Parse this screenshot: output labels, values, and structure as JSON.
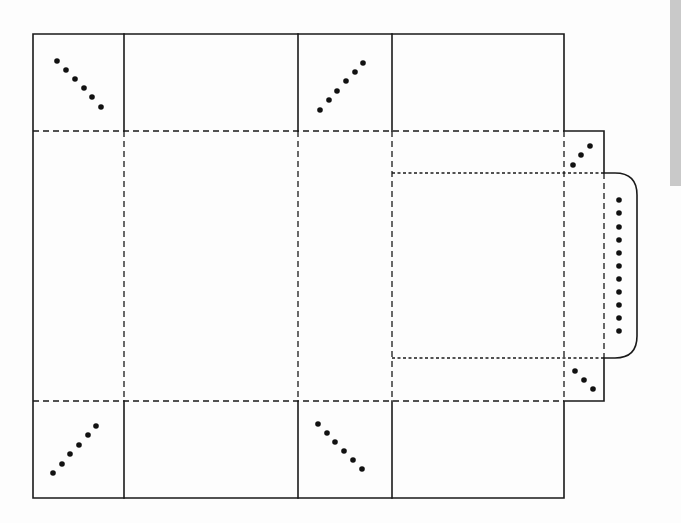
{
  "figure": {
    "title": ""
  },
  "colors": {
    "line": "#1a1a1a",
    "dot": "#111111",
    "background": "#fdfdfd",
    "edge_bar": "#c9c9c9"
  },
  "geometry": {
    "columns_x": [
      33,
      124,
      298,
      392,
      564
    ],
    "rows_y": [
      34,
      131,
      401,
      498
    ],
    "side_tab": {
      "x1": 564,
      "x2": 604,
      "top_y1": 131,
      "top_y2": 173,
      "bottom_y1": 358,
      "bottom_y2": 401
    },
    "inner_panel": {
      "x1": 392,
      "x2": 604,
      "y1": 173,
      "y2": 358
    },
    "rounded_flap": {
      "x1": 604,
      "x2": 637,
      "y1": 173,
      "y2": 358,
      "radius": 22
    }
  },
  "glue_markers": [
    {
      "name": "top-left-corner-flap",
      "points": [
        [
          57,
          61
        ],
        [
          66,
          70
        ],
        [
          75,
          79
        ],
        [
          84,
          88
        ],
        [
          92,
          97
        ],
        [
          101,
          107
        ]
      ]
    },
    {
      "name": "top-mid-corner-flap",
      "points": [
        [
          320,
          110
        ],
        [
          329,
          100
        ],
        [
          337,
          91
        ],
        [
          346,
          81
        ],
        [
          355,
          72
        ],
        [
          363,
          63
        ]
      ]
    },
    {
      "name": "bottom-left-corner-flap",
      "points": [
        [
          53,
          473
        ],
        [
          62,
          464
        ],
        [
          70,
          454
        ],
        [
          79,
          445
        ],
        [
          88,
          435
        ],
        [
          96,
          426
        ]
      ]
    },
    {
      "name": "bottom-mid-corner-flap",
      "points": [
        [
          318,
          424
        ],
        [
          327,
          433
        ],
        [
          335,
          442
        ],
        [
          344,
          451
        ],
        [
          353,
          460
        ],
        [
          362,
          469
        ]
      ]
    },
    {
      "name": "top-side-tab",
      "points": [
        [
          573,
          165
        ],
        [
          581,
          155
        ],
        [
          590,
          146
        ]
      ]
    },
    {
      "name": "bottom-side-tab",
      "points": [
        [
          575,
          371
        ],
        [
          584,
          380
        ],
        [
          593,
          389
        ]
      ]
    },
    {
      "name": "rounded-flap",
      "points": [
        [
          619,
          200
        ],
        [
          619,
          213
        ],
        [
          619,
          227
        ],
        [
          619,
          240
        ],
        [
          619,
          253
        ],
        [
          619,
          266
        ],
        [
          619,
          279
        ],
        [
          619,
          292
        ],
        [
          619,
          305
        ],
        [
          619,
          318
        ],
        [
          619,
          331
        ]
      ]
    }
  ],
  "labels": []
}
